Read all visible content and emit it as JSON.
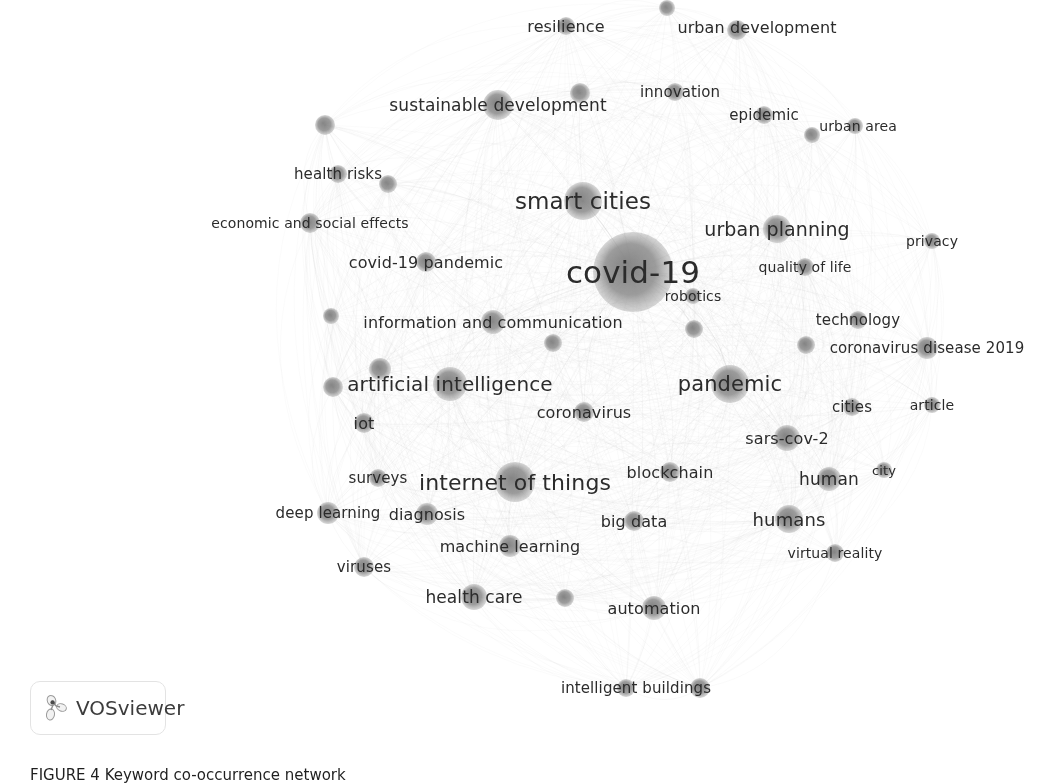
{
  "figure": {
    "caption": "FIGURE 4  Keyword co-occurrence network",
    "background_color": "#ffffff",
    "node_color": "#8a8a8a",
    "edge_color": "#bcbcbc",
    "label_color": "#2b2b2b"
  },
  "branding": {
    "logo_text": "VOSviewer",
    "logo_icon": "vosviewer-cluster-icon"
  },
  "chart_data": {
    "type": "scatter",
    "title": "Keyword co-occurrence network",
    "xlabel": "",
    "ylabel": "",
    "xlim": [
      0,
      1057
    ],
    "ylim": [
      0,
      783
    ],
    "grid": false,
    "legend": "none",
    "node_count": 46,
    "nodes": [
      {
        "label": "resilience",
        "x": 566,
        "y": 26,
        "size": 9,
        "font": 16
      },
      {
        "label": "urban development",
        "x": 737,
        "y": 30,
        "size": 10,
        "font": 16
      },
      {
        "label": "",
        "x": 667,
        "y": 8,
        "size": 8,
        "font": 0
      },
      {
        "label": "innovation",
        "x": 675,
        "y": 92,
        "size": 9,
        "font": 15
      },
      {
        "label": "sustainable development",
        "x": 498,
        "y": 105,
        "size": 15,
        "font": 17
      },
      {
        "label": "",
        "x": 580,
        "y": 93,
        "size": 10,
        "font": 0
      },
      {
        "label": "epidemic",
        "x": 764,
        "y": 115,
        "size": 9,
        "font": 15
      },
      {
        "label": "urban area",
        "x": 855,
        "y": 126,
        "size": 8,
        "font": 14
      },
      {
        "label": "",
        "x": 812,
        "y": 135,
        "size": 8,
        "font": 0
      },
      {
        "label": "",
        "x": 325,
        "y": 125,
        "size": 10,
        "font": 0
      },
      {
        "label": "health risks",
        "x": 338,
        "y": 174,
        "size": 9,
        "font": 15
      },
      {
        "label": "",
        "x": 388,
        "y": 184,
        "size": 9,
        "font": 0
      },
      {
        "label": "smart cities",
        "x": 583,
        "y": 201,
        "size": 19,
        "font": 23
      },
      {
        "label": "economic and social effects",
        "x": 310,
        "y": 223,
        "size": 10,
        "font": 14
      },
      {
        "label": "urban planning",
        "x": 777,
        "y": 229,
        "size": 14,
        "font": 19
      },
      {
        "label": "privacy",
        "x": 932,
        "y": 241,
        "size": 8,
        "font": 14
      },
      {
        "label": "covid-19 pandemic",
        "x": 426,
        "y": 262,
        "size": 10,
        "font": 16
      },
      {
        "label": "covid-19",
        "x": 633,
        "y": 272,
        "size": 40,
        "font": 31
      },
      {
        "label": "quality of life",
        "x": 805,
        "y": 267,
        "size": 9,
        "font": 14
      },
      {
        "label": "robotics",
        "x": 693,
        "y": 296,
        "size": 8,
        "font": 14
      },
      {
        "label": "information and communication",
        "x": 493,
        "y": 322,
        "size": 12,
        "font": 16
      },
      {
        "label": "",
        "x": 331,
        "y": 316,
        "size": 8,
        "font": 0
      },
      {
        "label": "technology",
        "x": 858,
        "y": 320,
        "size": 9,
        "font": 15
      },
      {
        "label": "",
        "x": 694,
        "y": 329,
        "size": 9,
        "font": 0
      },
      {
        "label": "coronavirus disease 2019",
        "x": 927,
        "y": 348,
        "size": 11,
        "font": 15
      },
      {
        "label": "",
        "x": 806,
        "y": 345,
        "size": 9,
        "font": 0
      },
      {
        "label": "",
        "x": 553,
        "y": 343,
        "size": 9,
        "font": 0
      },
      {
        "label": "",
        "x": 380,
        "y": 369,
        "size": 11,
        "font": 0
      },
      {
        "label": "artificial intelligence",
        "x": 450,
        "y": 384,
        "size": 17,
        "font": 20
      },
      {
        "label": "pandemic",
        "x": 730,
        "y": 384,
        "size": 19,
        "font": 21
      },
      {
        "label": "",
        "x": 333,
        "y": 387,
        "size": 10,
        "font": 0
      },
      {
        "label": "cities",
        "x": 852,
        "y": 407,
        "size": 9,
        "font": 15
      },
      {
        "label": "article",
        "x": 932,
        "y": 405,
        "size": 8,
        "font": 14
      },
      {
        "label": "coronavirus",
        "x": 584,
        "y": 412,
        "size": 10,
        "font": 16
      },
      {
        "label": "iot",
        "x": 364,
        "y": 423,
        "size": 10,
        "font": 16
      },
      {
        "label": "sars-cov-2",
        "x": 787,
        "y": 438,
        "size": 13,
        "font": 16
      },
      {
        "label": "human",
        "x": 829,
        "y": 479,
        "size": 12,
        "font": 17
      },
      {
        "label": "city",
        "x": 884,
        "y": 470,
        "size": 8,
        "font": 13
      },
      {
        "label": "blockchain",
        "x": 670,
        "y": 472,
        "size": 10,
        "font": 16
      },
      {
        "label": "surveys",
        "x": 378,
        "y": 478,
        "size": 9,
        "font": 15
      },
      {
        "label": "internet of things",
        "x": 515,
        "y": 482,
        "size": 20,
        "font": 22
      },
      {
        "label": "deep learning",
        "x": 328,
        "y": 513,
        "size": 11,
        "font": 15
      },
      {
        "label": "diagnosis",
        "x": 427,
        "y": 514,
        "size": 11,
        "font": 16
      },
      {
        "label": "big data",
        "x": 634,
        "y": 521,
        "size": 10,
        "font": 16
      },
      {
        "label": "humans",
        "x": 789,
        "y": 519,
        "size": 14,
        "font": 18
      },
      {
        "label": "machine learning",
        "x": 510,
        "y": 546,
        "size": 11,
        "font": 16
      },
      {
        "label": "virtual reality",
        "x": 835,
        "y": 553,
        "size": 9,
        "font": 14
      },
      {
        "label": "viruses",
        "x": 364,
        "y": 567,
        "size": 10,
        "font": 15
      },
      {
        "label": "health care",
        "x": 474,
        "y": 597,
        "size": 13,
        "font": 17
      },
      {
        "label": "",
        "x": 565,
        "y": 598,
        "size": 9,
        "font": 0
      },
      {
        "label": "automation",
        "x": 654,
        "y": 608,
        "size": 12,
        "font": 16
      },
      {
        "label": "intelligent buildings",
        "x": 626,
        "y": 688,
        "size": 9,
        "font": 15
      },
      {
        "label": "",
        "x": 700,
        "y": 688,
        "size": 10,
        "font": 0
      }
    ],
    "labels": [
      {
        "text": "resilience",
        "x": 566,
        "y": 26,
        "font": 16
      },
      {
        "text": "urban development",
        "x": 757,
        "y": 27,
        "font": 16
      },
      {
        "text": "innovation",
        "x": 680,
        "y": 92,
        "font": 15
      },
      {
        "text": "sustainable development",
        "x": 498,
        "y": 105,
        "font": 17
      },
      {
        "text": "epidemic",
        "x": 764,
        "y": 115,
        "font": 15
      },
      {
        "text": "urban area",
        "x": 858,
        "y": 126,
        "font": 14
      },
      {
        "text": "health risks",
        "x": 338,
        "y": 174,
        "font": 15
      },
      {
        "text": "smart cities",
        "x": 583,
        "y": 201,
        "font": 23
      },
      {
        "text": "economic and social effects",
        "x": 310,
        "y": 223,
        "font": 14
      },
      {
        "text": "urban planning",
        "x": 777,
        "y": 229,
        "font": 19
      },
      {
        "text": "privacy",
        "x": 932,
        "y": 241,
        "font": 14
      },
      {
        "text": "covid-19 pandemic",
        "x": 426,
        "y": 262,
        "font": 16
      },
      {
        "text": "covid-19",
        "x": 633,
        "y": 272,
        "font": 31
      },
      {
        "text": "quality of life",
        "x": 805,
        "y": 267,
        "font": 14
      },
      {
        "text": "robotics",
        "x": 693,
        "y": 296,
        "font": 14
      },
      {
        "text": "information and communication",
        "x": 493,
        "y": 322,
        "font": 16
      },
      {
        "text": "technology",
        "x": 858,
        "y": 320,
        "font": 15
      },
      {
        "text": "coronavirus disease 2019",
        "x": 927,
        "y": 348,
        "font": 15
      },
      {
        "text": "artificial intelligence",
        "x": 450,
        "y": 384,
        "font": 20
      },
      {
        "text": "pandemic",
        "x": 730,
        "y": 384,
        "font": 21
      },
      {
        "text": "cities",
        "x": 852,
        "y": 407,
        "font": 15
      },
      {
        "text": "article",
        "x": 932,
        "y": 405,
        "font": 14
      },
      {
        "text": "coronavirus",
        "x": 584,
        "y": 412,
        "font": 16
      },
      {
        "text": "iot",
        "x": 364,
        "y": 423,
        "font": 16
      },
      {
        "text": "sars-cov-2",
        "x": 787,
        "y": 438,
        "font": 16
      },
      {
        "text": "human",
        "x": 829,
        "y": 479,
        "font": 17
      },
      {
        "text": "city",
        "x": 884,
        "y": 470,
        "font": 13
      },
      {
        "text": "blockchain",
        "x": 670,
        "y": 472,
        "font": 16
      },
      {
        "text": "surveys",
        "x": 378,
        "y": 478,
        "font": 15
      },
      {
        "text": "internet of things",
        "x": 515,
        "y": 482,
        "font": 22
      },
      {
        "text": "deep learning",
        "x": 328,
        "y": 513,
        "font": 15
      },
      {
        "text": "diagnosis",
        "x": 427,
        "y": 514,
        "font": 16
      },
      {
        "text": "big data",
        "x": 634,
        "y": 521,
        "font": 16
      },
      {
        "text": "humans",
        "x": 789,
        "y": 519,
        "font": 18
      },
      {
        "text": "machine learning",
        "x": 510,
        "y": 546,
        "font": 16
      },
      {
        "text": "virtual reality",
        "x": 835,
        "y": 553,
        "font": 14
      },
      {
        "text": "viruses",
        "x": 364,
        "y": 567,
        "font": 15
      },
      {
        "text": "health care",
        "x": 474,
        "y": 597,
        "font": 17
      },
      {
        "text": "automation",
        "x": 654,
        "y": 608,
        "font": 16
      },
      {
        "text": "intelligent buildings",
        "x": 636,
        "y": 688,
        "font": 15
      }
    ]
  }
}
